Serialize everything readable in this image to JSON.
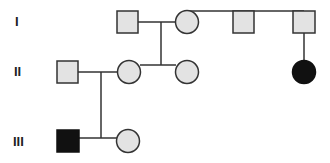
{
  "diagram": {
    "type": "pedigree",
    "generations": [
      {
        "label": "I"
      },
      {
        "label": "II"
      },
      {
        "label": "III"
      }
    ],
    "colors": {
      "unaffected_fill": "#e3e3e3",
      "affected_fill": "#111111",
      "stroke": "#333333"
    },
    "individuals": [
      {
        "id": "I-1",
        "sex": "male",
        "affected": false
      },
      {
        "id": "I-2",
        "sex": "female",
        "affected": false
      },
      {
        "id": "I-3",
        "sex": "male",
        "affected": false
      },
      {
        "id": "I-4",
        "sex": "male",
        "affected": false
      },
      {
        "id": "II-1",
        "sex": "male",
        "affected": false
      },
      {
        "id": "II-2",
        "sex": "female",
        "affected": false
      },
      {
        "id": "II-3",
        "sex": "female",
        "affected": false
      },
      {
        "id": "II-4",
        "sex": "female",
        "affected": true
      },
      {
        "id": "III-1",
        "sex": "male",
        "affected": true
      },
      {
        "id": "III-2",
        "sex": "female",
        "affected": false
      }
    ]
  }
}
